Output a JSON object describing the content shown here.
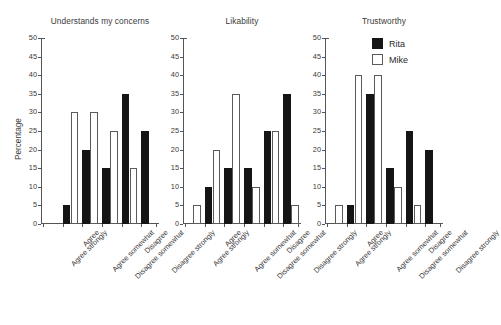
{
  "chart_data": {
    "type": "bar",
    "title": "",
    "xlabel": "",
    "ylabel": "Percentage",
    "ylim": [
      0,
      50
    ],
    "ytick_step": 5,
    "yticks": [
      0,
      5,
      10,
      15,
      20,
      25,
      30,
      35,
      40,
      45,
      50
    ],
    "grid": false,
    "legend_position": "top-right",
    "categories": [
      "Agree strongly",
      "Agree",
      "Agree somewhat",
      "Disagree somewhat",
      "Disagree",
      "Disagree strongly"
    ],
    "legend": [
      {
        "name": "Rita",
        "color": "#151515",
        "style": "filled"
      },
      {
        "name": "Mike",
        "color": "#ffffff",
        "style": "outlined"
      }
    ],
    "panels": [
      {
        "title": "Understands my concerns",
        "series": [
          {
            "name": "Rita",
            "values": [
              0,
              5,
              20,
              15,
              35,
              25
            ]
          },
          {
            "name": "Mike",
            "values": [
              0,
              30,
              30,
              25,
              15,
              0
            ]
          }
        ]
      },
      {
        "title": "Likability",
        "series": [
          {
            "name": "Rita",
            "values": [
              0,
              10,
              15,
              15,
              25,
              35
            ]
          },
          {
            "name": "Mike",
            "values": [
              5,
              20,
              35,
              10,
              25,
              5
            ]
          }
        ]
      },
      {
        "title": "Trustworthy",
        "series": [
          {
            "name": "Rita",
            "values": [
              0,
              5,
              35,
              15,
              25,
              20
            ]
          },
          {
            "name": "Mike",
            "values": [
              5,
              40,
              40,
              10,
              5,
              0
            ]
          }
        ]
      }
    ]
  }
}
